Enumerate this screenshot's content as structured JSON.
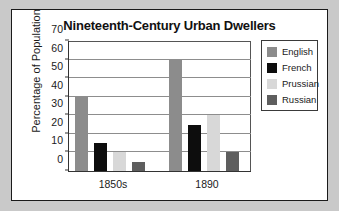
{
  "chart_data": {
    "type": "bar",
    "title": "Nineteenth-Century Urban Dwellers",
    "xlabel": "",
    "ylabel": "Percentage of Population",
    "categories": [
      "1850s",
      "1890"
    ],
    "ylim": [
      0,
      70
    ],
    "ytick_step": 10,
    "yticks": [
      70,
      60,
      50,
      40,
      30,
      20,
      10,
      0
    ],
    "grid": true,
    "legend_position": "right",
    "series": [
      {
        "name": "English",
        "color": "#8c8c8c",
        "values": [
          40,
          60
        ]
      },
      {
        "name": "French",
        "color": "#0d0d0d",
        "values": [
          15,
          25
        ]
      },
      {
        "name": "Prussian",
        "color": "#d8d8d8",
        "values": [
          10,
          30
        ]
      },
      {
        "name": "Russian",
        "color": "#5e5e5e",
        "values": [
          5,
          10
        ]
      }
    ]
  }
}
